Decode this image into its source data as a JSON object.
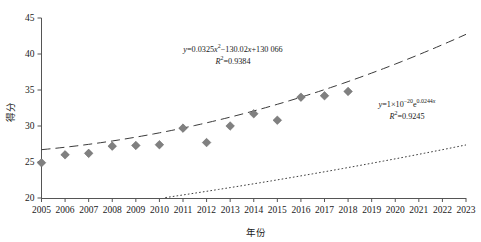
{
  "chart_data": {
    "type": "scatter",
    "title": "",
    "xlabel": "年份",
    "ylabel": "得分",
    "xlim": [
      2005,
      2023
    ],
    "ylim": [
      20,
      45
    ],
    "grid": false,
    "legend": "none",
    "x_ticks": [
      "2005",
      "2006",
      "2007",
      "2008",
      "2009",
      "2010",
      "2011",
      "2012",
      "2013",
      "2014",
      "2015",
      "2016",
      "2017",
      "2018",
      "2019",
      "2020",
      "2021",
      "2022",
      "2023"
    ],
    "y_ticks": [
      "20",
      "25",
      "30",
      "35",
      "40",
      "45"
    ],
    "marker_color": "#808080",
    "series": [
      {
        "name": "得分",
        "x": [
          2005,
          2006,
          2007,
          2008,
          2009,
          2010,
          2011,
          2012,
          2013,
          2014,
          2015,
          2016,
          2017,
          2018
        ],
        "values": [
          24.9,
          26.0,
          26.2,
          27.2,
          27.3,
          27.4,
          29.7,
          27.7,
          30.0,
          31.7,
          30.8,
          34.0,
          34.2,
          34.8
        ]
      }
    ],
    "trendlines": [
      {
        "name": "quadratic-trendline",
        "style": "long-dashed",
        "equation_html": "<i>y</i>=0.0325<i>x</i><sup>2</sup>&#8722;130.02<i>x</i>+130 066",
        "r2_html": "<i>R</i><sup>2</sup>=0.9384",
        "a": 0.0325,
        "b": -130.02,
        "c": 130066,
        "r2": 0.9384
      },
      {
        "name": "exponential-trendline",
        "style": "dotted",
        "equation_html": "<i>y</i>=1&#215;10<sup>&#8722;20</sup>e<sup>0.0244<i>x</i></sup>",
        "r2_html": "<i>R</i><sup>2</sup>=0.9245",
        "coefficient": 1e-20,
        "rate": 0.0244,
        "r2": 0.9245
      }
    ]
  }
}
